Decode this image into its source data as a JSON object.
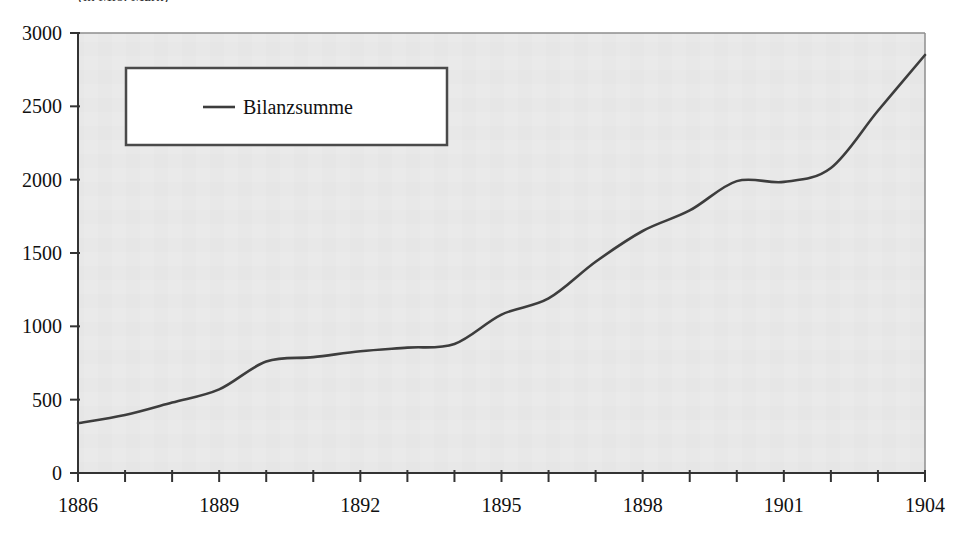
{
  "figure": {
    "title_clipped": "(in Mio. Mark)",
    "background_color": "#ffffff",
    "plot_background_color": "#e8e8e8",
    "axis_color": "#333333",
    "line_color": "#3d3d3d"
  },
  "legend": {
    "position": "upper-left-inside",
    "box_fill": "#ffffff",
    "box_border": "#4a4a4a",
    "entries": [
      {
        "label": "Bilanzsumme",
        "marker": "line",
        "color": "#3d3d3d"
      }
    ]
  },
  "axes": {
    "y_tick_labels": [
      "0",
      "500",
      "1000",
      "1500",
      "2000",
      "2500",
      "3000"
    ],
    "x_tick_labels": [
      "1886",
      "1889",
      "1892",
      "1895",
      "1898",
      "1901",
      "1904"
    ]
  },
  "chart_data": {
    "type": "line",
    "title": "(in Mio. Mark)",
    "xlabel": "",
    "ylabel": "",
    "xlim": [
      1886,
      1904
    ],
    "ylim": [
      0,
      3000
    ],
    "yticks": [
      0,
      500,
      1000,
      1500,
      2000,
      2500,
      3000
    ],
    "xticks": [
      1886,
      1889,
      1892,
      1895,
      1898,
      1901,
      1904
    ],
    "x_minor_tick_interval": 1,
    "grid": false,
    "legend_position": "upper left",
    "x": [
      1886,
      1887,
      1888,
      1889,
      1890,
      1891,
      1892,
      1893,
      1894,
      1895,
      1896,
      1897,
      1898,
      1899,
      1900,
      1901,
      1902,
      1903,
      1904
    ],
    "series": [
      {
        "name": "Bilanzsumme",
        "color": "#3d3d3d",
        "values": [
          340,
          395,
          480,
          570,
          760,
          790,
          830,
          855,
          880,
          1080,
          1190,
          1440,
          1650,
          1790,
          1990,
          1985,
          2080,
          2470,
          2850
        ]
      }
    ]
  }
}
